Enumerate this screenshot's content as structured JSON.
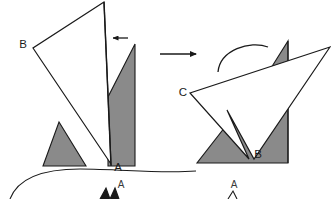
{
  "figure": {
    "colors": {
      "shade": "#8a8a8a",
      "stroke": "#1a1a1a",
      "background": "#ffffff",
      "label": "#1a1a1a"
    }
  },
  "left_panel": {
    "name": "before-shape",
    "labels": {
      "vertex_b": "B",
      "vertex_a": "A"
    },
    "fold_line": {
      "present": true,
      "orientation": "vertical"
    },
    "fold_arrow": {
      "direction": "left",
      "glyph": "←"
    },
    "white_polygon_points": "104,2 33,48 41,60 111,164",
    "shade_left_triangle_points": "43,165 86,165 59,122",
    "shade_right_polygon_points": "108,166 108,97 135,44 135,166",
    "fold_line_from": [
      104,
      2
    ],
    "fold_line_to": [
      111,
      166
    ]
  },
  "transform_arrow": {
    "name": "transform-arrow",
    "direction": "right",
    "from": [
      160,
      54
    ],
    "to": [
      198,
      54
    ]
  },
  "right_panel": {
    "name": "after-shape",
    "labels": {
      "vertex_c": "C",
      "vertex_b": "B"
    },
    "rotation_arc": {
      "present": true,
      "direction": "clockwise"
    },
    "white_polygon_points": "330,47 190,93 249,159 227,110 254,159",
    "shade_triangles_points": "197,163 288,163 288,41 271,68",
    "shade_baseline_y": 163
  },
  "bottom": {
    "curve": {
      "present": true,
      "description": "sweeping boundary curve"
    },
    "clipped_labels": [
      {
        "text": "A",
        "x": 118,
        "y": 187
      },
      {
        "text": "A",
        "x": 232,
        "y": 187
      }
    ]
  }
}
